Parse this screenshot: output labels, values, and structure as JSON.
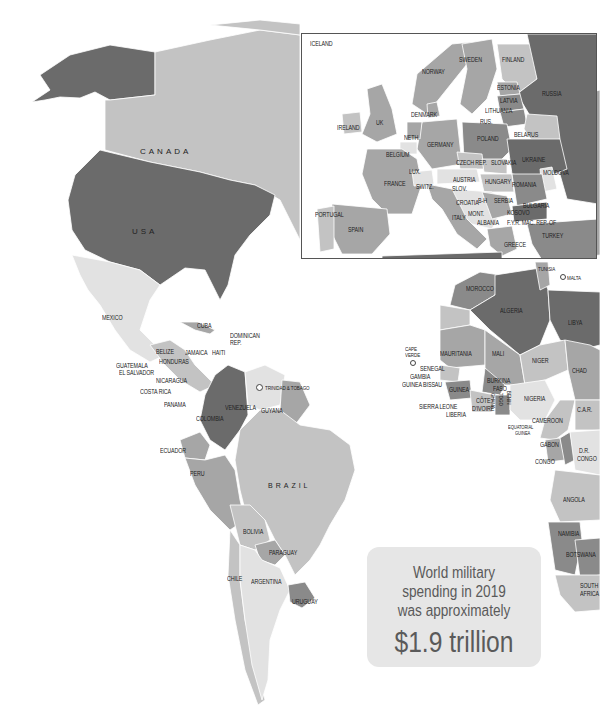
{
  "colors": {
    "background": "#ffffff",
    "shade_darkest": "#6b6b6b",
    "shade_dark": "#8a8a8a",
    "shade_mid": "#a6a6a6",
    "shade_light": "#c3c3c3",
    "shade_lightest": "#e2e2e2",
    "callout_bg": "#e6e6e6",
    "callout_text": "#5a5a5a"
  },
  "callout": {
    "line1": "World military",
    "line2": "spending in 2019",
    "line3": "was approximately",
    "amount": "$1.9 trillion"
  },
  "labels": {
    "north_america": {
      "canada": "CANADA",
      "usa": "USA",
      "mexico": "MEXICO",
      "cuba": "CUBA",
      "dominican_rep_1": "DOMINICAN",
      "dominican_rep_2": "REP.",
      "belize": "BELIZE",
      "jamaica": "JAMAICA",
      "haiti": "HAITI",
      "guatemala": "GUATEMALA",
      "honduras": "HONDURAS",
      "el_salvador": "EL SALVADOR",
      "nicaragua": "NICARAGUA",
      "costa_rica": "COSTA RICA",
      "panama": "PANAMA",
      "trinidad_tobago": "TRINIDAD & TOBAGO"
    },
    "south_america": {
      "colombia": "COLOMBIA",
      "venezuela": "VENEZUELA",
      "guyana": "GUYANA",
      "ecuador": "ECUADOR",
      "peru": "PERU",
      "brazil": "BRAZIL",
      "bolivia": "BOLIVIA",
      "paraguay": "PARAGUAY",
      "chile": "CHILE",
      "argentina": "ARGENTINA",
      "uruguay": "URUGUAY"
    },
    "europe_inset": {
      "iceland": "ICELAND",
      "norway": "NORWAY",
      "sweden": "SWEDEN",
      "finland": "FINLAND",
      "estonia": "ESTONIA",
      "russia": "RUSSIA",
      "latvia": "LATVIA",
      "lithuania": "LITHUANIA",
      "denmark": "DENMARK",
      "rus": "RUS.",
      "ireland": "IRELAND",
      "uk": "UK",
      "neth": "NETH.",
      "germany": "GERMANY",
      "poland": "POLAND",
      "belarus": "BELARUS",
      "belgium": "BELGIUM",
      "lux": "LUX.",
      "czech_rep": "CZECH REP.",
      "slovakia": "SLOVAKIA",
      "ukraine": "UKRAINE",
      "moldova": "MOLDOVA",
      "austria": "AUSTRIA",
      "hungary": "HUNGARY",
      "france": "FRANCE",
      "switz": "SWITZ.",
      "slov": "SLOV.",
      "romania": "ROMANIA",
      "croatia": "CROATIA",
      "bh": "B-H",
      "serbia": "SERBIA",
      "bulgaria": "BULGARIA",
      "kosovo": "KOSOVO",
      "mont": "MONT.",
      "portugal": "PORTUGAL",
      "italy": "ITALY",
      "albania": "ALBANIA",
      "fyr_mac": "F.Y.R. MAC. REP. OF",
      "spain": "SPAIN",
      "turkey": "TURKEY",
      "greece": "GREECE"
    },
    "africa": {
      "tunisia": "TUNISIA",
      "malta": "MALTA",
      "morocco": "MOROCCO",
      "algeria": "ALGERIA",
      "libya": "LIBYA",
      "cape_verde_1": "CAPE",
      "cape_verde_2": "VERDE",
      "mauritania": "MAURITANIA",
      "mali": "MALI",
      "niger": "NIGER",
      "senegal": "SENEGAL",
      "gambia": "GAMBIA",
      "guinea_bissau": "GUINEA BISSAU",
      "burkina_1": "BURKINA",
      "burkina_2": "FASO",
      "chad": "CHAD",
      "guinea": "GUINEA",
      "sierra_leone": "SIERRA LEONE",
      "liberia": "LIBERIA",
      "cote_1": "CÔTE",
      "cote_2": "D'IVOIRE",
      "ghana": "GHANA",
      "togo": "TOGO",
      "benin": "BENIN",
      "nigeria": "NIGERIA",
      "car": "C.A.R.",
      "cameroon": "CAMEROON",
      "eq_guinea_1": "EQUATORIAL",
      "eq_guinea_2": "GUINEA",
      "gabon": "GABON",
      "congo": "CONGO",
      "drc_1": "D.R.",
      "drc_2": "CONGO",
      "angola": "ANGOLA",
      "namibia": "NAMIBIA",
      "botswana": "BOTSWANA",
      "south_africa_1": "SOUTH",
      "south_africa_2": "AFRICA"
    }
  }
}
